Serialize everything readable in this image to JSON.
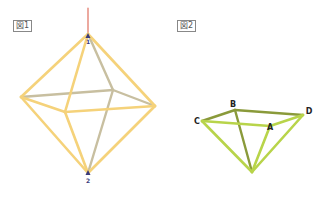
{
  "figure1": {
    "label": "図1",
    "colors": {
      "front_edges": "#f5d27a",
      "back_edges": "#c8bfa0",
      "axis": "#e07060",
      "markers": "#3a3a7a"
    },
    "vertex_labels": {
      "top": "1",
      "bottom": "2"
    }
  },
  "figure2": {
    "label": "図2",
    "colors": {
      "light_edges": "#b8d44a",
      "dark_edges": "#8a9a3a"
    },
    "vertex_labels": {
      "a": "A",
      "b": "B",
      "c": "C",
      "d": "D"
    }
  }
}
